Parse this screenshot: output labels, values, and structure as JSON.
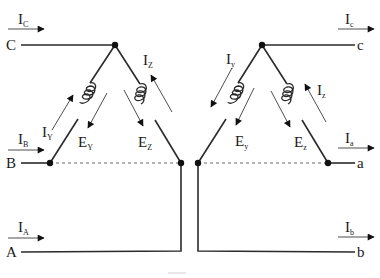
{
  "diagram": {
    "type": "delta-delta transformer connection",
    "primary": {
      "terminals": [
        {
          "id": "C",
          "label": "C",
          "current": "I",
          "current_sub": "C"
        },
        {
          "id": "B",
          "label": "B",
          "current": "I",
          "current_sub": "B"
        },
        {
          "id": "A",
          "label": "A",
          "current": "I",
          "current_sub": "A"
        }
      ],
      "windings": [
        {
          "id": "Y",
          "current": "I",
          "current_sub": "Y",
          "emf": "E",
          "emf_sub": "Y"
        },
        {
          "id": "Z",
          "current": "I",
          "current_sub": "Z",
          "emf": "E",
          "emf_sub": "Z"
        }
      ]
    },
    "secondary": {
      "terminals": [
        {
          "id": "c",
          "label": "c",
          "current": "I",
          "current_sub": "c"
        },
        {
          "id": "a",
          "label": "a",
          "current": "I",
          "current_sub": "a"
        },
        {
          "id": "b",
          "label": "b",
          "current": "I",
          "current_sub": "b"
        }
      ],
      "windings": [
        {
          "id": "y",
          "current": "I",
          "current_sub": "y",
          "emf": "E",
          "emf_sub": "y"
        },
        {
          "id": "z",
          "current": "I",
          "current_sub": "z",
          "emf": "E",
          "emf_sub": "z"
        }
      ]
    },
    "colors": {
      "line": "#2a2a2a",
      "dashed": "#666666",
      "background": "#ffffff"
    }
  }
}
